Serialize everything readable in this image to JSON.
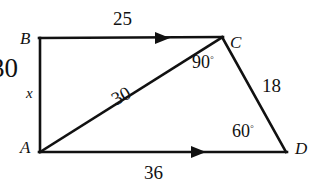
{
  "figure": {
    "stroke_color": "#111111",
    "background_color": "#ffffff",
    "vertices": [
      {
        "name": "B",
        "label": "B",
        "x": 40,
        "y": 38
      },
      {
        "name": "C",
        "label": "C",
        "x": 222,
        "y": 37
      },
      {
        "name": "D",
        "label": "D",
        "x": 286,
        "y": 152
      },
      {
        "name": "A",
        "label": "A",
        "x": 40,
        "y": 152
      }
    ],
    "vertex_labels": {
      "B": "B",
      "C": "C",
      "D": "D",
      "A": "A"
    },
    "side_lengths": {
      "BC": "25",
      "CD": "18",
      "AD": "36",
      "AC": "30",
      "AB_clipped": "30",
      "AB_variable": "x"
    },
    "angles": {
      "ACD": "90",
      "ADC": "60",
      "degree_symbol": "◦"
    },
    "angle_labels": {
      "at_C": "90",
      "at_D": "60"
    },
    "parallel_marks": [
      {
        "name": "arrow-on-BC",
        "on": "BC",
        "x": 160,
        "y": 38
      },
      {
        "name": "arrow-on-AD",
        "on": "AD",
        "x": 196,
        "y": 152
      }
    ]
  }
}
